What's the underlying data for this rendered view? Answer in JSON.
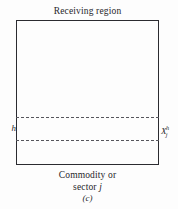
{
  "figure": {
    "panel_caption": "(c)",
    "top_label": "Receiving region",
    "bottom_label_line1": "Commodity or",
    "bottom_label_line2_prefix": "sector ",
    "bottom_label_line2_symbol": "j",
    "left_symbol": "h",
    "right_symbol": {
      "base": "X",
      "subscript": "j",
      "superscript": "h"
    },
    "colors": {
      "background": "#fdfdfd",
      "border": "#2b2b30",
      "dash": "#55555c",
      "text": "#26262a"
    },
    "box": {
      "x": 16,
      "y": 20,
      "width": 143,
      "height": 145
    },
    "dashed_lines": [
      {
        "name": "upper",
        "y": 117
      },
      {
        "name": "lower",
        "y": 140
      }
    ]
  }
}
